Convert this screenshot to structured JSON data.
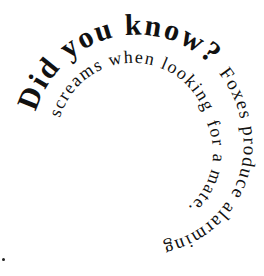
{
  "graphic": {
    "title": "Did you know?",
    "fact": "Foxes produce alarming screams when looking for a mate.",
    "segments": [
      {
        "text": "Did you know?",
        "size": 30
      },
      {
        "text": "Foxes produce alarming",
        "size": 19
      },
      {
        "text": "screams when looking",
        "size": 18
      },
      {
        "text": "for a mate.",
        "size": 18
      }
    ],
    "text_color": "#111111",
    "background": "#ffffff",
    "layout": "clockwise spiral, shrinking inward"
  }
}
